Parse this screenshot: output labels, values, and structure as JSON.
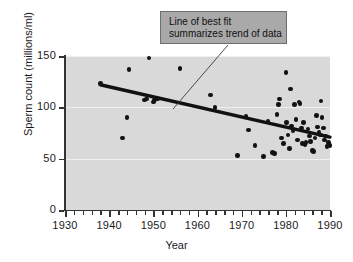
{
  "chart_data": {
    "type": "scatter",
    "title": "",
    "xlabel": "Year",
    "ylabel": "Sperm count (millions/ml)",
    "xlim": [
      1930,
      1990
    ],
    "ylim": [
      0,
      150
    ],
    "xticks": [
      1930,
      1940,
      1950,
      1960,
      1970,
      1980,
      1990
    ],
    "xtick_labels": [
      "1930",
      "1940",
      "1950",
      "1960",
      "1970",
      "1980",
      "1990"
    ],
    "yticks": [
      0,
      50,
      100,
      150
    ],
    "ytick_labels": [
      "0",
      "50",
      "100",
      "150"
    ],
    "minor_xtick_interval": 2,
    "grid": "horizontal-gridlines-at-50-100-150",
    "legend": "none",
    "plot_background_color": "#d9d9d9",
    "point_color": "#121212",
    "trendline_color": "#111111",
    "points": [
      {
        "x": 1938,
        "y": 123
      },
      {
        "x": 1943,
        "y": 70
      },
      {
        "x": 1944,
        "y": 90
      },
      {
        "x": 1944.5,
        "y": 137
      },
      {
        "x": 1948,
        "y": 107
      },
      {
        "x": 1948.5,
        "y": 108
      },
      {
        "x": 1949,
        "y": 148
      },
      {
        "x": 1950,
        "y": 105
      },
      {
        "x": 1950.3,
        "y": 107
      },
      {
        "x": 1951,
        "y": 108
      },
      {
        "x": 1956,
        "y": 138
      },
      {
        "x": 1963,
        "y": 112
      },
      {
        "x": 1964,
        "y": 100
      },
      {
        "x": 1969,
        "y": 53
      },
      {
        "x": 1971,
        "y": 91
      },
      {
        "x": 1971.5,
        "y": 78
      },
      {
        "x": 1973,
        "y": 63
      },
      {
        "x": 1975,
        "y": 52
      },
      {
        "x": 1976,
        "y": 86
      },
      {
        "x": 1977,
        "y": 56
      },
      {
        "x": 1977.5,
        "y": 55
      },
      {
        "x": 1978,
        "y": 93
      },
      {
        "x": 1978.3,
        "y": 103
      },
      {
        "x": 1978.6,
        "y": 108
      },
      {
        "x": 1979,
        "y": 70
      },
      {
        "x": 1979.5,
        "y": 65
      },
      {
        "x": 1980,
        "y": 134
      },
      {
        "x": 1980.2,
        "y": 85
      },
      {
        "x": 1980.5,
        "y": 73
      },
      {
        "x": 1980.8,
        "y": 60
      },
      {
        "x": 1981,
        "y": 118
      },
      {
        "x": 1981.3,
        "y": 82
      },
      {
        "x": 1981.6,
        "y": 77
      },
      {
        "x": 1982,
        "y": 103
      },
      {
        "x": 1982.3,
        "y": 88
      },
      {
        "x": 1982.6,
        "y": 68
      },
      {
        "x": 1983,
        "y": 105
      },
      {
        "x": 1983.2,
        "y": 104
      },
      {
        "x": 1983.5,
        "y": 80
      },
      {
        "x": 1983.8,
        "y": 65
      },
      {
        "x": 1984,
        "y": 85
      },
      {
        "x": 1984.3,
        "y": 64
      },
      {
        "x": 1984.6,
        "y": 66
      },
      {
        "x": 1985,
        "y": 79
      },
      {
        "x": 1985.3,
        "y": 72
      },
      {
        "x": 1985.6,
        "y": 67
      },
      {
        "x": 1986,
        "y": 58
      },
      {
        "x": 1986.3,
        "y": 57
      },
      {
        "x": 1986.6,
        "y": 70
      },
      {
        "x": 1987,
        "y": 92
      },
      {
        "x": 1987.2,
        "y": 81
      },
      {
        "x": 1987.5,
        "y": 76
      },
      {
        "x": 1987.8,
        "y": 73
      },
      {
        "x": 1988,
        "y": 106
      },
      {
        "x": 1988.2,
        "y": 90
      },
      {
        "x": 1988.5,
        "y": 80
      },
      {
        "x": 1988.8,
        "y": 68
      },
      {
        "x": 1989,
        "y": 72
      },
      {
        "x": 1989.3,
        "y": 62
      },
      {
        "x": 1989.6,
        "y": 66
      },
      {
        "x": 1990,
        "y": 63
      }
    ],
    "trendline": {
      "name": "Line of best fit",
      "x_start": 1938,
      "y_start": 122,
      "x_end": 1990,
      "y_end": 71
    }
  },
  "annotation": {
    "line1": "Line of best fit",
    "line2": "summarizes trend of data",
    "leader_from": {
      "x": 228,
      "y": 45
    },
    "leader_to": {
      "x": 173,
      "y": 109
    }
  }
}
